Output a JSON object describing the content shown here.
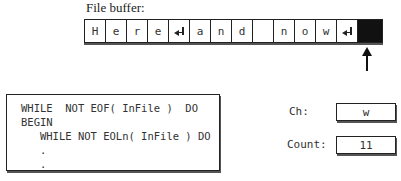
{
  "buffer": {
    "label": "File buffer:",
    "cells": [
      {
        "char": "H",
        "type": "char"
      },
      {
        "char": "e",
        "type": "char"
      },
      {
        "char": "r",
        "type": "char"
      },
      {
        "char": "e",
        "type": "char"
      },
      {
        "char": "",
        "type": "eoln"
      },
      {
        "char": "a",
        "type": "char"
      },
      {
        "char": "n",
        "type": "char"
      },
      {
        "char": "d",
        "type": "char"
      },
      {
        "char": " ",
        "type": "char"
      },
      {
        "char": "n",
        "type": "char"
      },
      {
        "char": "o",
        "type": "char"
      },
      {
        "char": "w",
        "type": "char"
      },
      {
        "char": "",
        "type": "eoln"
      },
      {
        "char": "",
        "type": "eof"
      }
    ],
    "pointer_position": 13
  },
  "code": {
    "lines": [
      "WHILE  NOT EOF( InFile )  DO",
      "BEGIN",
      "   WHILE NOT EOLn( InFile ) DO",
      "   .",
      "   ."
    ]
  },
  "vars": {
    "ch_label": "Ch:",
    "ch_value": "w",
    "count_label": "Count:",
    "count_value": "11"
  }
}
